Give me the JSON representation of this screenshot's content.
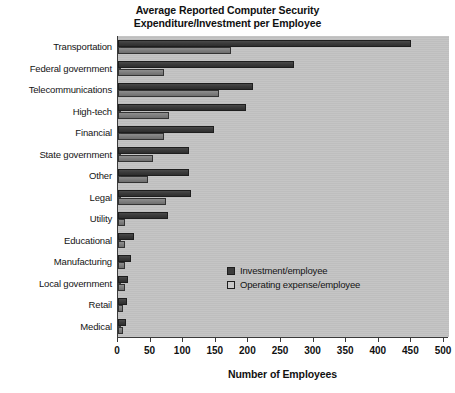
{
  "chart_data": {
    "type": "bar",
    "orientation": "horizontal",
    "title": "Average Reported Computer Security Expenditure/Investment per Employee",
    "title_line1": "Average Reported Computer Security",
    "title_line2": "Expenditure/Investment per Employee",
    "xlabel": "Number of Employees",
    "ylabel": "",
    "xlim": [
      0,
      500
    ],
    "xticks": [
      0,
      50,
      100,
      150,
      200,
      250,
      300,
      350,
      400,
      450,
      500
    ],
    "xtick_labels": [
      "0",
      "50",
      "100",
      "150",
      "200",
      "250",
      "300",
      "350",
      "400",
      "450",
      "500"
    ],
    "grid": false,
    "legend_position": "inside-center-right",
    "categories": [
      "Transportation",
      "Federal government",
      "Telecommunications",
      "High-tech",
      "Financial",
      "State government",
      "Other",
      "Legal",
      "Utility",
      "Educational",
      "Manufacturing",
      "Local government",
      "Retail",
      "Medical"
    ],
    "series": [
      {
        "name": "Investment/employee",
        "color": "#3b3b3b",
        "values": [
          450,
          270,
          207,
          196,
          147,
          109,
          109,
          112,
          77,
          25,
          20,
          16,
          14,
          12
        ]
      },
      {
        "name": "Operating expense/employee",
        "color": "#7d7d7d",
        "values": [
          173,
          70,
          155,
          78,
          70,
          54,
          46,
          74,
          11,
          11,
          11,
          10,
          8,
          7
        ]
      }
    ]
  },
  "legend": {
    "items": [
      {
        "label": "Investment/employee",
        "swatch": "dark-swatch"
      },
      {
        "label": "Operating expense/employee",
        "swatch": "light-swatch"
      }
    ]
  },
  "colors": {
    "plot_background": "#c2c2c2",
    "page_background": "#ffffff",
    "axis": "#3a3a3a",
    "investment_bar": "#3b3b3b",
    "operating_bar": "#7d7d7d"
  }
}
